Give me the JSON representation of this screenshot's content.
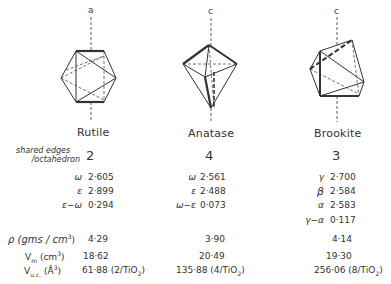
{
  "figure": {
    "columns": [
      {
        "name": "Rutile",
        "axis_label": "a",
        "shared_edges": "2",
        "refractive": [
          {
            "symbol": "ω",
            "value": "2·605"
          },
          {
            "symbol": "ε",
            "value": "2·899"
          },
          {
            "symbol": "ε−ω",
            "value": "0·294"
          }
        ],
        "density": "4·29",
        "molar_volume": "18·62",
        "unit_cell_volume": "61·88 (2/TiO",
        "unit_cell_tail": ")"
      },
      {
        "name": "Anatase",
        "axis_label": "c",
        "shared_edges": "4",
        "refractive": [
          {
            "symbol": "ω",
            "value": "2·561"
          },
          {
            "symbol": "ε",
            "value": "2·488"
          },
          {
            "symbol": "ω−ε",
            "value": "0·073"
          }
        ],
        "density": "3·90",
        "molar_volume": "20·49",
        "unit_cell_volume": "135·88 (4/TiO",
        "unit_cell_tail": ")"
      },
      {
        "name": "Brookite",
        "axis_label": "c",
        "shared_edges": "3",
        "refractive": [
          {
            "symbol": "γ",
            "value": "2·700"
          },
          {
            "symbol": "β",
            "value": "2·584"
          },
          {
            "symbol": "α",
            "value": "2·583"
          },
          {
            "symbol": "γ−α",
            "value": "0·117"
          }
        ],
        "density": "4·14",
        "molar_volume": "19·30",
        "unit_cell_volume": "256·06 (8/TiO",
        "unit_cell_tail": ")"
      }
    ],
    "row_labels": {
      "shared_edges_line1": "shared edges",
      "shared_edges_line2": "/octahedron",
      "density": "ρ (gms / cm",
      "density_tail": ")",
      "molar_volume": "V",
      "molar_volume_sub": "m",
      "molar_volume_unit": " (cm",
      "molar_volume_tail": ")",
      "unit_cell": "V",
      "unit_cell_sub": "u.c.",
      "unit_cell_unit": " (Å",
      "unit_cell_tail": ")",
      "cube": "3",
      "oxide_sub": "2"
    },
    "icons": [
      "rutile-octahedron-icon",
      "anatase-octahedron-icon",
      "brookite-octahedron-icon"
    ]
  }
}
